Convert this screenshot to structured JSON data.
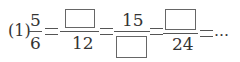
{
  "problem": {
    "label": "(1)",
    "fractions": [
      {
        "numerator": "5",
        "denominator": "6"
      },
      {
        "numerator": "",
        "denominator": "12",
        "numerator_blank": true
      },
      {
        "numerator": "15",
        "denominator": "",
        "denominator_blank": true
      },
      {
        "numerator": "",
        "denominator": "24",
        "numerator_blank": true
      }
    ],
    "ellipsis": "…"
  }
}
